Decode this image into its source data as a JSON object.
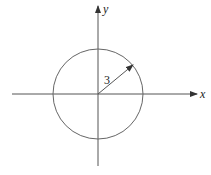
{
  "diagram": {
    "type": "circle-on-coordinate-axes",
    "axes": {
      "x_label": "x",
      "y_label": "y",
      "origin": [
        98,
        94
      ],
      "x_axis_extent": [
        12,
        197
      ],
      "y_axis_extent": [
        6,
        166
      ]
    },
    "circle": {
      "center": [
        98,
        94
      ],
      "radius_px": 45,
      "radius_label": "3"
    },
    "radius_arrow": {
      "from": [
        98,
        94
      ],
      "to": [
        133,
        65
      ],
      "label": "3"
    },
    "colors": {
      "stroke": "#555555",
      "text": "#222222",
      "background": "#ffffff"
    }
  }
}
